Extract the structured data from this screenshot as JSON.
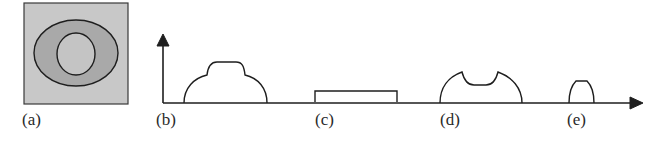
{
  "figure": {
    "panels": [
      {
        "id": "a",
        "label": "(a)",
        "description": "square region with outer ellipse and inner circle"
      },
      {
        "id": "b",
        "label": "(b)",
        "description": "dome profile with raised central plateau"
      },
      {
        "id": "c",
        "label": "(c)",
        "description": "flat rectangular step profile"
      },
      {
        "id": "d",
        "label": "(d)",
        "description": "dome profile with central depression"
      },
      {
        "id": "e",
        "label": "(e)",
        "description": "narrow dome profile"
      }
    ],
    "colors": {
      "outer_fill": "#c8c8c8",
      "ellipse_fill": "#a9a9a9",
      "inner_fill": "#c4c4c4",
      "stroke": "#1e1e1e"
    }
  }
}
